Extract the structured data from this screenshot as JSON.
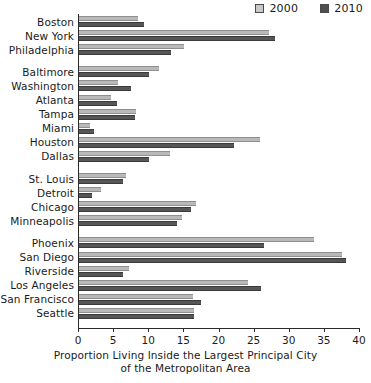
{
  "legend": {
    "position": "top-right",
    "entries": [
      {
        "label": "2000",
        "color": "#b9b9b9",
        "name": "legend-2000"
      },
      {
        "label": "2010",
        "color": "#565656",
        "name": "legend-2010"
      }
    ]
  },
  "axis": {
    "xlabel_line1": "Proportion Living Inside the Largest Principal City",
    "xlabel_line2": "of the Metropolitan Area",
    "ticks": [
      "0",
      "5",
      "10",
      "15",
      "20",
      "25",
      "30",
      "35",
      "40"
    ]
  },
  "chart_data": {
    "type": "bar",
    "orientation": "horizontal",
    "title": "",
    "xlabel": "Proportion Living Inside the Largest Principal City of the Metropolitan Area",
    "ylabel": "",
    "xlim": [
      0,
      40
    ],
    "xticks": [
      0,
      5,
      10,
      15,
      20,
      25,
      30,
      35,
      40
    ],
    "grid": false,
    "legend_position": "top right",
    "groups": [
      {
        "name": "northeast",
        "categories": [
          "Boston",
          "New York",
          "Philadelphia"
        ]
      },
      {
        "name": "south",
        "categories": [
          "Baltimore",
          "Washington",
          "Atlanta",
          "Tampa",
          "Miami",
          "Houston",
          "Dallas"
        ]
      },
      {
        "name": "midwest",
        "categories": [
          "St. Louis",
          "Detroit",
          "Chicago",
          "Minneapolis"
        ]
      },
      {
        "name": "west",
        "categories": [
          "Phoenix",
          "San Diego",
          "Riverside",
          "Los Angeles",
          "San Francisco",
          "Seattle"
        ]
      }
    ],
    "categories": [
      "Boston",
      "New York",
      "Philadelphia",
      "Baltimore",
      "Washington",
      "Atlanta",
      "Tampa",
      "Miami",
      "Houston",
      "Dallas",
      "St. Louis",
      "Detroit",
      "Chicago",
      "Minneapolis",
      "Phoenix",
      "San Diego",
      "Riverside",
      "Los Angeles",
      "San Francisco",
      "Seattle"
    ],
    "series": [
      {
        "name": "2000",
        "color": "#b9b9b9",
        "values": [
          8.4,
          27.0,
          15.0,
          11.4,
          5.6,
          4.6,
          8.1,
          1.6,
          25.7,
          12.9,
          6.7,
          3.1,
          16.7,
          14.7,
          33.4,
          37.5,
          7.1,
          24.0,
          16.2,
          16.3
        ]
      },
      {
        "name": "2010",
        "color": "#565656",
        "values": [
          9.3,
          27.9,
          13.1,
          10.0,
          7.4,
          5.4,
          8.0,
          2.1,
          22.0,
          10.0,
          6.3,
          1.9,
          16.0,
          13.9,
          26.3,
          38.0,
          6.3,
          25.9,
          17.4,
          16.4
        ]
      }
    ]
  }
}
